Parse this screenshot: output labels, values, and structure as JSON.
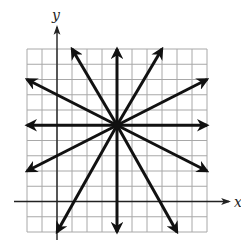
{
  "figure": {
    "axes": {
      "x_label": "x",
      "y_label": "y"
    },
    "grid": {
      "x_min": -2,
      "x_max": 10,
      "y_min": -2,
      "y_max": 10,
      "step": 1,
      "visible": true
    },
    "center_point": [
      4,
      5
    ],
    "rays": [
      {
        "id": "up",
        "end": [
          4,
          10
        ]
      },
      {
        "id": "down",
        "end": [
          4,
          -2
        ]
      },
      {
        "id": "left",
        "end": [
          -2,
          5
        ]
      },
      {
        "id": "right",
        "end": [
          10,
          5
        ]
      },
      {
        "id": "up-left-steep",
        "end": [
          1,
          10
        ]
      },
      {
        "id": "up-right-steep",
        "end": [
          7,
          10
        ]
      },
      {
        "id": "up-left-shallow",
        "end": [
          -2,
          8
        ]
      },
      {
        "id": "up-right-shallow",
        "end": [
          10,
          8
        ]
      },
      {
        "id": "down-left-shallow",
        "end": [
          -2,
          2
        ]
      },
      {
        "id": "down-right-shallow",
        "end": [
          10,
          2
        ]
      },
      {
        "id": "down-left-steep",
        "end": [
          0,
          -2
        ]
      },
      {
        "id": "down-right-steep",
        "end": [
          8,
          -2
        ]
      }
    ],
    "colors": {
      "grid": "#a8a8a8",
      "axes": "#222222",
      "rays": "#111111"
    }
  }
}
